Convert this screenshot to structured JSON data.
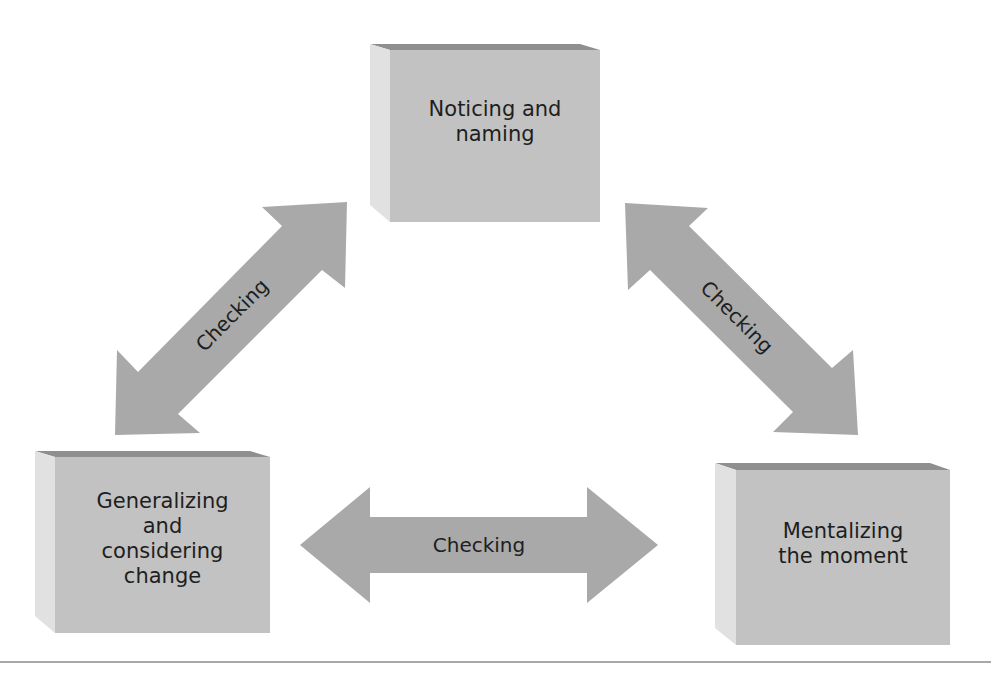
{
  "colors": {
    "box_front": "#c2c2c2",
    "box_top": "#8f8f8f",
    "box_side": "#e1e1e1",
    "arrow_fill": "#a9a9a9",
    "text": "#1e1e1e",
    "rule": "#a9a9a9"
  },
  "nodes": [
    {
      "id": "top",
      "label": "Noticing and\nnaming"
    },
    {
      "id": "bottom-left",
      "label": "Generalizing\nand\nconsidering\nchange"
    },
    {
      "id": "bottom-right",
      "label": "Mentalizing\nthe moment"
    }
  ],
  "edges": [
    {
      "from": "bottom-left",
      "to": "top",
      "label": "Checking",
      "bidirectional": true
    },
    {
      "from": "top",
      "to": "bottom-right",
      "label": "Checking",
      "bidirectional": true
    },
    {
      "from": "bottom-left",
      "to": "bottom-right",
      "label": "Checking",
      "bidirectional": true
    }
  ]
}
